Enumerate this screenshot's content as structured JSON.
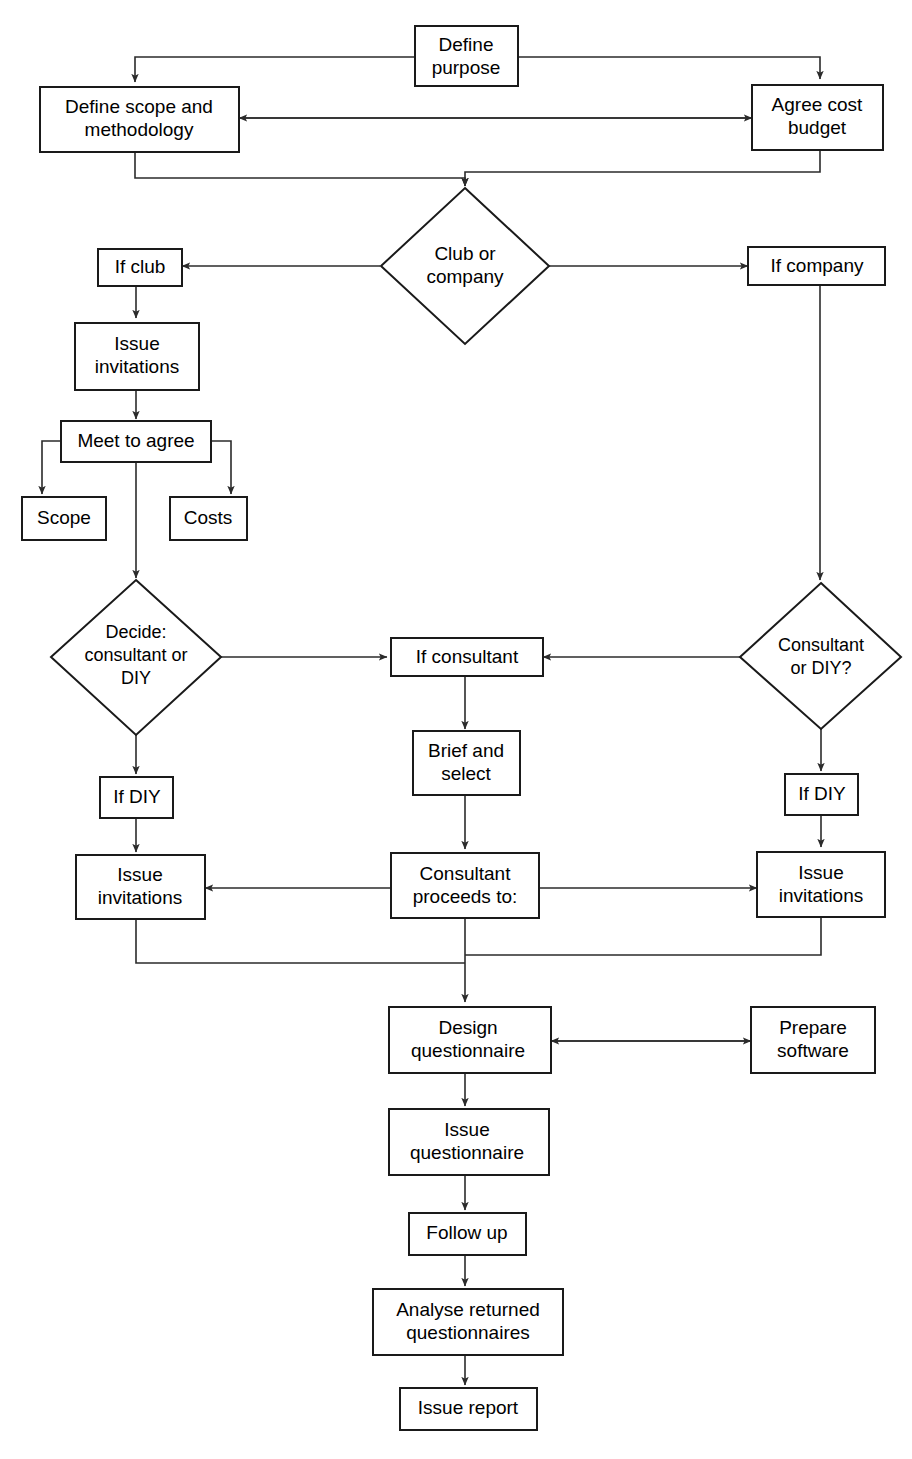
{
  "diagram": {
    "type": "flowchart",
    "colors": {
      "background": "#ffffff",
      "stroke": "#1a1a1a",
      "edge": "#2b2b2b",
      "text": "#000000"
    },
    "nodes": [
      {
        "id": "define-purpose",
        "shape": "rect",
        "lines": [
          "Define",
          "purpose"
        ]
      },
      {
        "id": "define-scope-methodology",
        "shape": "rect",
        "lines": [
          "Define scope and",
          "methodology"
        ]
      },
      {
        "id": "agree-cost-budget",
        "shape": "rect",
        "lines": [
          "Agree cost",
          "budget"
        ]
      },
      {
        "id": "club-or-company",
        "shape": "diamond",
        "lines": [
          "Club or",
          "company"
        ]
      },
      {
        "id": "if-club",
        "shape": "rect",
        "lines": [
          "If club"
        ]
      },
      {
        "id": "if-company",
        "shape": "rect",
        "lines": [
          "If company"
        ]
      },
      {
        "id": "issue-invitations-club",
        "shape": "rect",
        "lines": [
          "Issue",
          "invitations"
        ]
      },
      {
        "id": "meet-to-agree",
        "shape": "rect",
        "lines": [
          "Meet to agree"
        ]
      },
      {
        "id": "scope",
        "shape": "rect",
        "lines": [
          "Scope"
        ]
      },
      {
        "id": "costs",
        "shape": "rect",
        "lines": [
          "Costs"
        ]
      },
      {
        "id": "decide-consultant-or-diy",
        "shape": "diamond",
        "lines": [
          "Decide:",
          "consultant or",
          "DIY"
        ]
      },
      {
        "id": "consultant-or-diy",
        "shape": "diamond",
        "lines": [
          "Consultant",
          "or DIY?"
        ]
      },
      {
        "id": "if-consultant",
        "shape": "rect",
        "lines": [
          "If consultant"
        ]
      },
      {
        "id": "brief-and-select",
        "shape": "rect",
        "lines": [
          "Brief and",
          "select"
        ]
      },
      {
        "id": "if-diy-left",
        "shape": "rect",
        "lines": [
          "If DIY"
        ]
      },
      {
        "id": "if-diy-right",
        "shape": "rect",
        "lines": [
          "If DIY"
        ]
      },
      {
        "id": "issue-invitations-left",
        "shape": "rect",
        "lines": [
          "Issue",
          "invitations"
        ]
      },
      {
        "id": "consultant-proceeds-to",
        "shape": "rect",
        "lines": [
          "Consultant",
          "proceeds to:"
        ]
      },
      {
        "id": "issue-invitations-right",
        "shape": "rect",
        "lines": [
          "Issue",
          "invitations"
        ]
      },
      {
        "id": "design-questionnaire",
        "shape": "rect",
        "lines": [
          "Design",
          "questionnaire"
        ]
      },
      {
        "id": "prepare-software",
        "shape": "rect",
        "lines": [
          "Prepare",
          "software"
        ]
      },
      {
        "id": "issue-questionnaire",
        "shape": "rect",
        "lines": [
          "Issue",
          "questionnaire"
        ]
      },
      {
        "id": "follow-up",
        "shape": "rect",
        "lines": [
          "Follow up"
        ]
      },
      {
        "id": "analyse-returned",
        "shape": "rect",
        "lines": [
          "Analyse returned",
          "questionnaires"
        ]
      },
      {
        "id": "issue-report",
        "shape": "rect",
        "lines": [
          "Issue report"
        ]
      }
    ],
    "edges": [
      {
        "from": "define-purpose",
        "to": "define-scope-methodology",
        "arrow": "single"
      },
      {
        "from": "define-purpose",
        "to": "agree-cost-budget",
        "arrow": "single"
      },
      {
        "from": "agree-cost-budget",
        "to": "define-scope-methodology",
        "arrow": "double"
      },
      {
        "from": "define-scope-methodology",
        "to": "club-or-company",
        "arrow": "single"
      },
      {
        "from": "agree-cost-budget",
        "to": "club-or-company",
        "arrow": "single"
      },
      {
        "from": "club-or-company",
        "to": "if-club",
        "arrow": "single"
      },
      {
        "from": "club-or-company",
        "to": "if-company",
        "arrow": "single"
      },
      {
        "from": "if-club",
        "to": "issue-invitations-club",
        "arrow": "single"
      },
      {
        "from": "issue-invitations-club",
        "to": "meet-to-agree",
        "arrow": "single"
      },
      {
        "from": "meet-to-agree",
        "to": "scope",
        "arrow": "single"
      },
      {
        "from": "meet-to-agree",
        "to": "costs",
        "arrow": "single"
      },
      {
        "from": "meet-to-agree",
        "to": "decide-consultant-or-diy",
        "arrow": "single"
      },
      {
        "from": "if-company",
        "to": "consultant-or-diy",
        "arrow": "single"
      },
      {
        "from": "decide-consultant-or-diy",
        "to": "if-consultant",
        "arrow": "single"
      },
      {
        "from": "decide-consultant-or-diy",
        "to": "if-diy-left",
        "arrow": "single"
      },
      {
        "from": "consultant-or-diy",
        "to": "if-consultant",
        "arrow": "single"
      },
      {
        "from": "consultant-or-diy",
        "to": "if-diy-right",
        "arrow": "single"
      },
      {
        "from": "if-consultant",
        "to": "brief-and-select",
        "arrow": "single"
      },
      {
        "from": "brief-and-select",
        "to": "consultant-proceeds-to",
        "arrow": "single"
      },
      {
        "from": "if-diy-left",
        "to": "issue-invitations-left",
        "arrow": "single"
      },
      {
        "from": "if-diy-right",
        "to": "issue-invitations-right",
        "arrow": "single"
      },
      {
        "from": "consultant-proceeds-to",
        "to": "issue-invitations-left",
        "arrow": "single"
      },
      {
        "from": "consultant-proceeds-to",
        "to": "issue-invitations-right",
        "arrow": "single"
      },
      {
        "from": "issue-invitations-left",
        "to": "design-questionnaire",
        "arrow": "single"
      },
      {
        "from": "issue-invitations-right",
        "to": "design-questionnaire",
        "arrow": "single"
      },
      {
        "from": "consultant-proceeds-to",
        "to": "design-questionnaire",
        "arrow": "single"
      },
      {
        "from": "prepare-software",
        "to": "design-questionnaire",
        "arrow": "double"
      },
      {
        "from": "design-questionnaire",
        "to": "issue-questionnaire",
        "arrow": "single"
      },
      {
        "from": "issue-questionnaire",
        "to": "follow-up",
        "arrow": "single"
      },
      {
        "from": "follow-up",
        "to": "analyse-returned",
        "arrow": "single"
      },
      {
        "from": "analyse-returned",
        "to": "issue-report",
        "arrow": "single"
      }
    ]
  }
}
